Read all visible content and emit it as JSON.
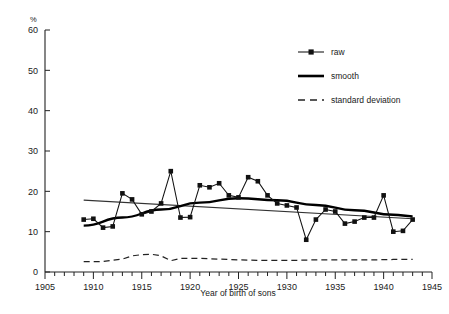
{
  "chart_data": {
    "type": "line",
    "title": "",
    "xlabel": "Year of birth of sons",
    "ylabel": "%",
    "unit_label": "%",
    "xlim": [
      1905,
      1945
    ],
    "ylim": [
      0,
      60
    ],
    "xticks": [
      1905,
      1910,
      1915,
      1920,
      1925,
      1930,
      1935,
      1940,
      1945
    ],
    "yticks": [
      0,
      10,
      20,
      30,
      40,
      50,
      60
    ],
    "xtick_labels": [
      "1905",
      "1910",
      "1915",
      "1920",
      "1925",
      "1930",
      "1935",
      "1940",
      "1945"
    ],
    "ytick_labels": [
      "0",
      "10",
      "20",
      "30",
      "40",
      "50",
      "60"
    ],
    "minor_xtick_step": 1,
    "grid": false,
    "legend_position": "top-right",
    "series": [
      {
        "name": "raw",
        "style": "line-markers",
        "marker": "square",
        "x": [
          1909,
          1910,
          1911,
          1912,
          1913,
          1914,
          1915,
          1916,
          1917,
          1918,
          1919,
          1920,
          1921,
          1922,
          1923,
          1924,
          1925,
          1926,
          1927,
          1928,
          1929,
          1930,
          1931,
          1932,
          1933,
          1934,
          1935,
          1936,
          1937,
          1938,
          1939,
          1940,
          1941,
          1942,
          1943
        ],
        "values": [
          13.0,
          13.2,
          11.0,
          11.3,
          19.5,
          18.0,
          14.3,
          15.0,
          17.0,
          25.0,
          13.5,
          13.6,
          21.5,
          21.0,
          22.0,
          19.0,
          18.5,
          23.5,
          22.5,
          19.0,
          17.0,
          16.5,
          16.0,
          8.0,
          13.0,
          15.5,
          15.0,
          12.0,
          12.5,
          13.5,
          13.5,
          19.0,
          10.0,
          10.2,
          13.0
        ]
      },
      {
        "name": "smooth",
        "style": "thick-line",
        "x": [
          1909,
          1913,
          1917,
          1921,
          1925,
          1929,
          1933,
          1937,
          1941,
          1943
        ],
        "values": [
          11.5,
          13.5,
          15.5,
          17.2,
          18.3,
          17.8,
          16.6,
          15.3,
          14.2,
          13.8
        ]
      },
      {
        "name": "trend",
        "style": "thin-line",
        "x": [
          1909,
          1943
        ],
        "values": [
          17.8,
          13.2
        ]
      },
      {
        "name": "standard deviation",
        "style": "dashed-line",
        "x": [
          1909,
          1911,
          1913,
          1914,
          1915,
          1916,
          1917,
          1918,
          1919,
          1921,
          1923,
          1925,
          1927,
          1929,
          1931,
          1933,
          1935,
          1937,
          1939,
          1941,
          1943
        ],
        "values": [
          2.6,
          2.6,
          3.2,
          4.0,
          4.3,
          4.4,
          4.0,
          2.8,
          3.4,
          3.4,
          3.2,
          3.0,
          2.9,
          2.9,
          2.9,
          3.0,
          3.0,
          3.0,
          3.0,
          3.1,
          3.1
        ]
      }
    ]
  },
  "legend": {
    "items": [
      {
        "label": "raw",
        "key": "raw"
      },
      {
        "label": "smooth",
        "key": "smooth"
      },
      {
        "label": "standard deviation",
        "key": "standard-deviation"
      }
    ]
  },
  "colors": {
    "line": "#111111",
    "axis": "#222222",
    "background": "#ffffff"
  }
}
